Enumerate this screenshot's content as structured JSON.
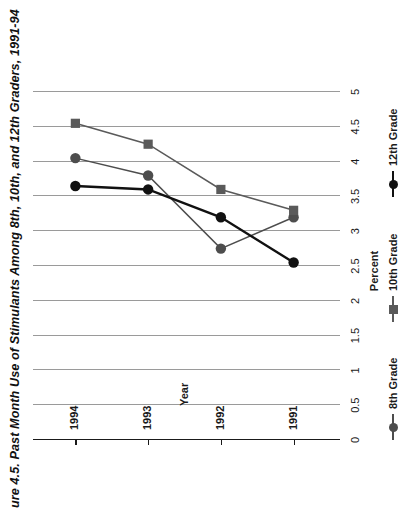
{
  "figure": {
    "title": "ure 4.5. Past Month Use of Stimulants Among 8th, 10th, and 12th Graders, 1991-94",
    "orientation": "rotated-90-ccw"
  },
  "chart_data": {
    "type": "line",
    "title": "ure 4.5. Past Month Use of Stimulants Among 8th, 10th, and 12th Graders, 1991-94",
    "xlabel": "Year",
    "ylabel": "Percent",
    "categories": [
      "1991",
      "1992",
      "1993",
      "1994"
    ],
    "x": [
      1991,
      1992,
      1993,
      1994
    ],
    "ylim": [
      0,
      5
    ],
    "ytick_labels": [
      "0",
      "0.5",
      "1",
      "1.5",
      "2",
      "2.5",
      "3",
      "3.5",
      "4",
      "4.5",
      "5"
    ],
    "ytick_values": [
      0,
      0.5,
      1,
      1.5,
      2,
      2.5,
      3,
      3.5,
      4,
      4.5,
      5
    ],
    "grid": true,
    "legend_position": "bottom",
    "series": [
      {
        "name": "8th Grade",
        "values": [
          3.2,
          2.75,
          3.8,
          4.05
        ],
        "color": "#4d4d4d",
        "marker": "circle"
      },
      {
        "name": "10th Grade",
        "values": [
          3.3,
          3.6,
          4.25,
          4.55
        ],
        "color": "#5a5a5a",
        "marker": "square"
      },
      {
        "name": "12th Grade",
        "values": [
          2.55,
          3.2,
          3.6,
          3.65
        ],
        "color": "#111111",
        "marker": "circle"
      }
    ]
  },
  "legend": {
    "items": [
      {
        "label": "8th Grade",
        "color": "#4d4d4d",
        "marker": "circle"
      },
      {
        "label": "10th Grade",
        "color": "#5a5a5a",
        "marker": "square"
      },
      {
        "label": "12th Grade",
        "color": "#111111",
        "marker": "circle"
      }
    ]
  },
  "colors": {
    "gridline": "#9a9a9a",
    "axis": "#1a1a1a",
    "background": "#ffffff",
    "text": "#1a1a1a"
  }
}
